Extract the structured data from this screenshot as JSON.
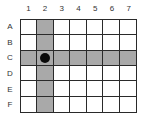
{
  "grid": {
    "columns": [
      "1",
      "2",
      "3",
      "4",
      "5",
      "6",
      "7"
    ],
    "rows": [
      "A",
      "B",
      "C",
      "D",
      "E",
      "F"
    ],
    "highlighted_column": "2",
    "highlighted_row": "C",
    "marker": {
      "row": "C",
      "column": "2",
      "shape": "filled-circle"
    },
    "colors": {
      "shade": "#a9a9a9",
      "line": "#2a2a2a",
      "marker": "#0a0a0a",
      "background": "#ffffff"
    }
  }
}
